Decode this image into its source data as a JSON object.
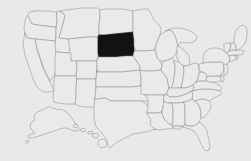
{
  "map": {
    "title": "United States map",
    "type": "choropleth-locator",
    "width": 251,
    "height": 161,
    "background_color": "#e9e9e9",
    "state_fill_color": "#eaeaea",
    "state_stroke_color": "#8f8f93",
    "highlight_fill_color": "#121212",
    "highlighted_states": [
      "South Dakota"
    ],
    "includes_insets": [
      "Alaska",
      "Hawaii"
    ],
    "inset_position": "lower-left",
    "labels_visible": false,
    "legend_visible": false,
    "states": [
      {
        "name": "Washington",
        "abbr": "WA",
        "highlighted": false
      },
      {
        "name": "Oregon",
        "abbr": "OR",
        "highlighted": false
      },
      {
        "name": "California",
        "abbr": "CA",
        "highlighted": false
      },
      {
        "name": "Nevada",
        "abbr": "NV",
        "highlighted": false
      },
      {
        "name": "Idaho",
        "abbr": "ID",
        "highlighted": false
      },
      {
        "name": "Montana",
        "abbr": "MT",
        "highlighted": false
      },
      {
        "name": "Wyoming",
        "abbr": "WY",
        "highlighted": false
      },
      {
        "name": "Utah",
        "abbr": "UT",
        "highlighted": false
      },
      {
        "name": "Arizona",
        "abbr": "AZ",
        "highlighted": false
      },
      {
        "name": "Colorado",
        "abbr": "CO",
        "highlighted": false
      },
      {
        "name": "New Mexico",
        "abbr": "NM",
        "highlighted": false
      },
      {
        "name": "North Dakota",
        "abbr": "ND",
        "highlighted": false
      },
      {
        "name": "South Dakota",
        "abbr": "SD",
        "highlighted": true
      },
      {
        "name": "Nebraska",
        "abbr": "NE",
        "highlighted": false
      },
      {
        "name": "Kansas",
        "abbr": "KS",
        "highlighted": false
      },
      {
        "name": "Oklahoma",
        "abbr": "OK",
        "highlighted": false
      },
      {
        "name": "Texas",
        "abbr": "TX",
        "highlighted": false
      },
      {
        "name": "Minnesota",
        "abbr": "MN",
        "highlighted": false
      },
      {
        "name": "Iowa",
        "abbr": "IA",
        "highlighted": false
      },
      {
        "name": "Missouri",
        "abbr": "MO",
        "highlighted": false
      },
      {
        "name": "Arkansas",
        "abbr": "AR",
        "highlighted": false
      },
      {
        "name": "Louisiana",
        "abbr": "LA",
        "highlighted": false
      },
      {
        "name": "Wisconsin",
        "abbr": "WI",
        "highlighted": false
      },
      {
        "name": "Illinois",
        "abbr": "IL",
        "highlighted": false
      },
      {
        "name": "Michigan",
        "abbr": "MI",
        "highlighted": false
      },
      {
        "name": "Indiana",
        "abbr": "IN",
        "highlighted": false
      },
      {
        "name": "Ohio",
        "abbr": "OH",
        "highlighted": false
      },
      {
        "name": "Kentucky",
        "abbr": "KY",
        "highlighted": false
      },
      {
        "name": "Tennessee",
        "abbr": "TN",
        "highlighted": false
      },
      {
        "name": "Mississippi",
        "abbr": "MS",
        "highlighted": false
      },
      {
        "name": "Alabama",
        "abbr": "AL",
        "highlighted": false
      },
      {
        "name": "Georgia",
        "abbr": "GA",
        "highlighted": false
      },
      {
        "name": "Florida",
        "abbr": "FL",
        "highlighted": false
      },
      {
        "name": "South Carolina",
        "abbr": "SC",
        "highlighted": false
      },
      {
        "name": "North Carolina",
        "abbr": "NC",
        "highlighted": false
      },
      {
        "name": "Virginia",
        "abbr": "VA",
        "highlighted": false
      },
      {
        "name": "West Virginia",
        "abbr": "WV",
        "highlighted": false
      },
      {
        "name": "Maryland",
        "abbr": "MD",
        "highlighted": false
      },
      {
        "name": "Delaware",
        "abbr": "DE",
        "highlighted": false
      },
      {
        "name": "Pennsylvania",
        "abbr": "PA",
        "highlighted": false
      },
      {
        "name": "New Jersey",
        "abbr": "NJ",
        "highlighted": false
      },
      {
        "name": "New York",
        "abbr": "NY",
        "highlighted": false
      },
      {
        "name": "Connecticut",
        "abbr": "CT",
        "highlighted": false
      },
      {
        "name": "Rhode Island",
        "abbr": "RI",
        "highlighted": false
      },
      {
        "name": "Massachusetts",
        "abbr": "MA",
        "highlighted": false
      },
      {
        "name": "Vermont",
        "abbr": "VT",
        "highlighted": false
      },
      {
        "name": "New Hampshire",
        "abbr": "NH",
        "highlighted": false
      },
      {
        "name": "Maine",
        "abbr": "ME",
        "highlighted": false
      },
      {
        "name": "Alaska",
        "abbr": "AK",
        "highlighted": false
      },
      {
        "name": "Hawaii",
        "abbr": "HI",
        "highlighted": false
      }
    ]
  }
}
